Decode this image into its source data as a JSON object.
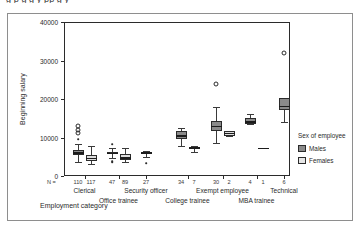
{
  "top_clipped_text": "g                     p            g   g         y pp            g  y",
  "chart_data": {
    "type": "box",
    "title": "",
    "xlabel": "Employment category",
    "ylabel": "Beginning salary",
    "ylim": [
      0,
      40000
    ],
    "yticks": [
      0,
      10000,
      20000,
      30000,
      40000
    ],
    "ytick_labels": [
      "0",
      "10000",
      "20000",
      "30000",
      "40000"
    ],
    "grid": false,
    "n_label": "N =",
    "legend": {
      "title": "Sex of employee",
      "position": "right",
      "entries": [
        {
          "name": "Males",
          "color": "#8a8a8a"
        },
        {
          "name": "Females",
          "color": "#e6e6e6"
        }
      ]
    },
    "categories": [
      "Clerical",
      "Office trainee",
      "Security officer",
      "College trainee",
      "Exempt employee",
      "MBA trainee",
      "Technical"
    ],
    "boxes": [
      {
        "category": "Clerical",
        "sex": "Males",
        "n": 110,
        "whisker_low": 3600,
        "q1": 5400,
        "median": 6000,
        "q3": 6800,
        "whisker_high": 8400,
        "outliers": [
          9600,
          11200,
          12000,
          13000
        ]
      },
      {
        "category": "Clerical",
        "sex": "Females",
        "n": 117,
        "whisker_low": 3200,
        "q1": 4000,
        "median": 4500,
        "q3": 5400,
        "whisker_high": 7800,
        "outliers": []
      },
      {
        "category": "Office trainee",
        "sex": "Males",
        "n": 47,
        "whisker_low": 4800,
        "q1": 5600,
        "median": 5900,
        "q3": 6200,
        "whisker_high": 7200,
        "outliers": [
          3600,
          3900,
          8200
        ]
      },
      {
        "category": "Office trainee",
        "sex": "Females",
        "n": 89,
        "whisker_low": 3700,
        "q1": 4200,
        "median": 4700,
        "q3": 5600,
        "whisker_high": 7400,
        "outliers": []
      },
      {
        "category": "Security officer",
        "sex": "Males",
        "n": 27,
        "whisker_low": 5000,
        "q1": 5600,
        "median": 6000,
        "q3": 6200,
        "whisker_high": 6600,
        "outliers": [
          3400
        ]
      },
      {
        "category": "College trainee",
        "sex": "Males",
        "n": 34,
        "whisker_low": 7800,
        "q1": 9600,
        "median": 10400,
        "q3": 11600,
        "whisker_high": 12400,
        "outliers": []
      },
      {
        "category": "College trainee",
        "sex": "Females",
        "n": 7,
        "whisker_low": 6200,
        "q1": 6900,
        "median": 7300,
        "q3": 7600,
        "whisker_high": 7900,
        "outliers": []
      },
      {
        "category": "Exempt employee",
        "sex": "Males",
        "n": 30,
        "whisker_low": 8600,
        "q1": 11600,
        "median": 12900,
        "q3": 14400,
        "whisker_high": 17800,
        "outliers": [
          24000
        ]
      },
      {
        "category": "Exempt employee",
        "sex": "Females",
        "n": 2,
        "whisker_low": 10400,
        "q1": 10400,
        "median": 11000,
        "q3": 11800,
        "whisker_high": 11800,
        "outliers": []
      },
      {
        "category": "MBA trainee",
        "sex": "Males",
        "n": 4,
        "whisker_low": 13400,
        "q1": 13600,
        "median": 14000,
        "q3": 15100,
        "whisker_high": 16200,
        "outliers": []
      },
      {
        "category": "MBA trainee",
        "sex": "Females",
        "n": 1,
        "whisker_low": 7100,
        "q1": 7100,
        "median": 7100,
        "q3": 7100,
        "whisker_high": 7100,
        "outliers": []
      },
      {
        "category": "Technical",
        "sex": "Males",
        "n": 6,
        "whisker_low": 14000,
        "q1": 17100,
        "median": 18000,
        "q3": 20200,
        "whisker_high": 20200,
        "outliers": [
          32000
        ]
      }
    ]
  }
}
